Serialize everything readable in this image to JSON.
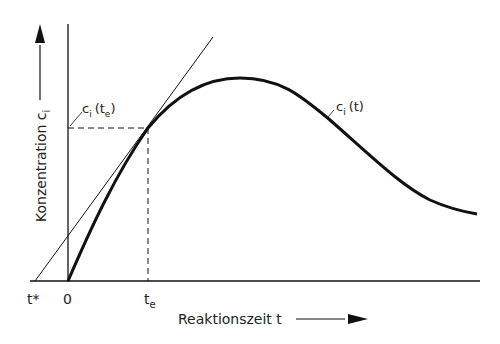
{
  "diagram": {
    "y_axis_label": "Konzentration c",
    "y_axis_label_sub": "i",
    "x_axis_label": "Reaktionszeit t",
    "tick_t_star": "t*",
    "tick_zero": "0",
    "tick_te": "t",
    "tick_te_sub": "e",
    "point_label": "c",
    "point_label_sub": "i",
    "point_label_args": "(t",
    "point_label_args_sub": "e",
    "point_label_close": ")",
    "curve_label": "c",
    "curve_label_sub": "i",
    "curve_label_args": "(t)",
    "line_color": "#111111"
  }
}
